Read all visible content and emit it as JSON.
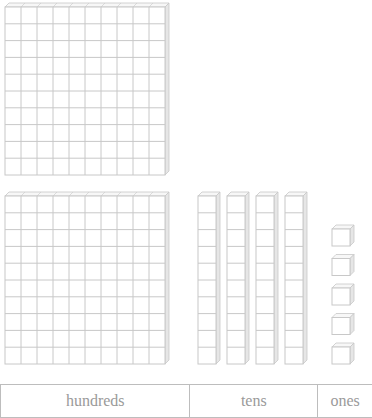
{
  "figure": {
    "hundreds_flats": 2,
    "tens_rods": 4,
    "ones_cubes": 5,
    "value_represented": 245
  },
  "place_value_table": {
    "columns": [
      {
        "label": "hundreds"
      },
      {
        "label": "tens"
      },
      {
        "label": "ones"
      }
    ]
  },
  "colors": {
    "grid_line": "#c8c8c8",
    "depth_face": "#e6e6e6",
    "text": "#9a9a9a"
  }
}
